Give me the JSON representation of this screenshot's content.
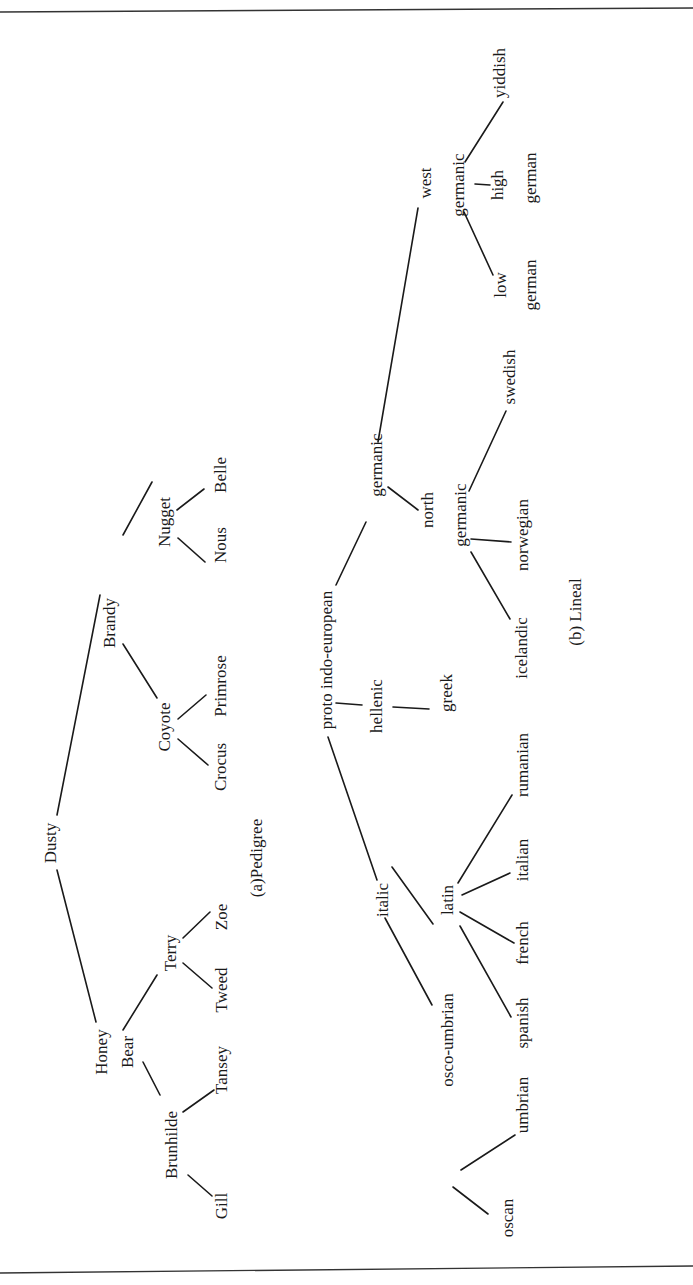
{
  "figure": {
    "orientation": "rotated 90 degrees counter-clockwise",
    "captions": {
      "pedigree": "(a)Pedigree",
      "lineal": "(b) Lineal"
    }
  },
  "pedigree": {
    "nodes": {
      "dusty": "Dusty",
      "honey_bear_1": "Honey",
      "honey_bear_2": "Bear",
      "brandy": "Brandy",
      "brunhilde": "Brunhilde",
      "terry": "Terry",
      "coyote": "Coyote",
      "nugget": "Nugget",
      "gill": "Gill",
      "tansey": "Tansey",
      "tweed": "Tweed",
      "zoe": "Zoe",
      "crocus": "Crocus",
      "primrose": "Primrose",
      "nous": "Nous",
      "belle": "Belle"
    },
    "edges": [
      [
        "Dusty",
        "Honey Bear"
      ],
      [
        "Dusty",
        "Brandy"
      ],
      [
        "Honey Bear",
        "Brunhilde"
      ],
      [
        "Honey Bear",
        "Terry"
      ],
      [
        "Brandy",
        "Coyote"
      ],
      [
        "Brandy",
        "Nugget"
      ],
      [
        "Brunhilde",
        "Gill"
      ],
      [
        "Brunhilde",
        "Tansey"
      ],
      [
        "Terry",
        "Tweed"
      ],
      [
        "Terry",
        "Zoe"
      ],
      [
        "Coyote",
        "Crocus"
      ],
      [
        "Coyote",
        "Primrose"
      ],
      [
        "Nugget",
        "Nous"
      ],
      [
        "Nugget",
        "Belle"
      ]
    ]
  },
  "lineal": {
    "nodes": {
      "proto": "proto indo-european",
      "italic": "italic",
      "hellenic": "hellenic",
      "germanic": "germanic",
      "osco_umbrian": "osco-umbrian",
      "latin": "latin",
      "greek": "greek",
      "north_1": "north",
      "north_2": "germanic",
      "west_1": "west",
      "west_2": "germanic",
      "oscan": "oscan",
      "umbrian": "umbrian",
      "spanish": "spanish",
      "french": "french",
      "italian": "italian",
      "rumanian": "rumanian",
      "icelandic": "icelandic",
      "norwegian": "norwegian",
      "swedish": "swedish",
      "low_1": "low",
      "low_2": "german",
      "high_1": "high",
      "high_2": "german",
      "yiddish": "yiddish"
    },
    "edges": [
      [
        "proto indo-european",
        "italic"
      ],
      [
        "proto indo-european",
        "hellenic"
      ],
      [
        "proto indo-european",
        "germanic"
      ],
      [
        "italic",
        "osco-umbrian"
      ],
      [
        "italic",
        "latin"
      ],
      [
        "hellenic",
        "greek"
      ],
      [
        "germanic",
        "north germanic"
      ],
      [
        "germanic",
        "west germanic"
      ],
      [
        "osco-umbrian",
        "oscan"
      ],
      [
        "osco-umbrian",
        "umbrian"
      ],
      [
        "latin",
        "spanish"
      ],
      [
        "latin",
        "french"
      ],
      [
        "latin",
        "italian"
      ],
      [
        "latin",
        "rumanian"
      ],
      [
        "north germanic",
        "icelandic"
      ],
      [
        "north germanic",
        "norwegian"
      ],
      [
        "north germanic",
        "swedish"
      ],
      [
        "west germanic",
        "low german"
      ],
      [
        "west germanic",
        "high german"
      ],
      [
        "west germanic",
        "yiddish"
      ]
    ]
  }
}
